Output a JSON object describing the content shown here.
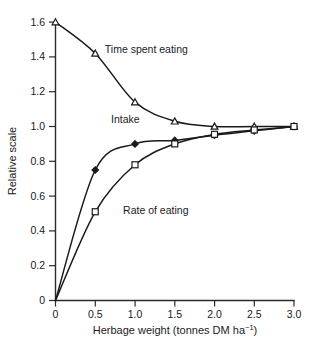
{
  "chart_data": {
    "type": "line",
    "title": "",
    "xlabel": "Herbage weight (tonnes DM ha⁻¹)",
    "xlabel_main": "Herbage weight (tonnes DM ha",
    "xlabel_sup": "−1",
    "xlabel_tail": ")",
    "ylabel": "Relative scale",
    "xlim": [
      0,
      3.0
    ],
    "ylim": [
      0,
      1.6
    ],
    "grid": false,
    "legend": "inline-annotations",
    "xticks": [
      0,
      0.5,
      1.0,
      1.5,
      2.0,
      2.5,
      3.0
    ],
    "xticklabels": [
      "0",
      "0.5",
      "1.0",
      "1.5",
      "2.0",
      "2.5",
      "3.0"
    ],
    "yticks": [
      0,
      0.2,
      0.4,
      0.6,
      0.8,
      1.0,
      1.2,
      1.4,
      1.6
    ],
    "yticklabels": [
      "0",
      "0.2",
      "0.4",
      "0.6",
      "0.8",
      "1.0",
      "1.2",
      "1.4",
      "1.6"
    ],
    "series": [
      {
        "name": "Time spent eating",
        "marker": "open-triangle",
        "x": [
          0,
          0.5,
          1.0,
          1.5,
          2.0,
          2.5,
          3.0
        ],
        "values": [
          1.6,
          1.42,
          1.14,
          1.03,
          1.0,
          1.0,
          1.0
        ],
        "label_x": 0.62,
        "label_y": 1.44
      },
      {
        "name": "Intake",
        "marker": "filled-diamond",
        "x": [
          0,
          0.5,
          1.0,
          1.5,
          2.0,
          2.5,
          3.0
        ],
        "values": [
          0.0,
          0.75,
          0.9,
          0.92,
          0.95,
          0.975,
          1.0
        ],
        "label_x": 0.7,
        "label_y": 1.04
      },
      {
        "name": "Rate of eating",
        "marker": "open-square",
        "x": [
          0,
          0.5,
          1.0,
          1.5,
          2.0,
          2.5,
          3.0
        ],
        "values": [
          0.0,
          0.51,
          0.78,
          0.9,
          0.955,
          0.98,
          1.0
        ],
        "label_x": 0.85,
        "label_y": 0.52
      }
    ]
  }
}
